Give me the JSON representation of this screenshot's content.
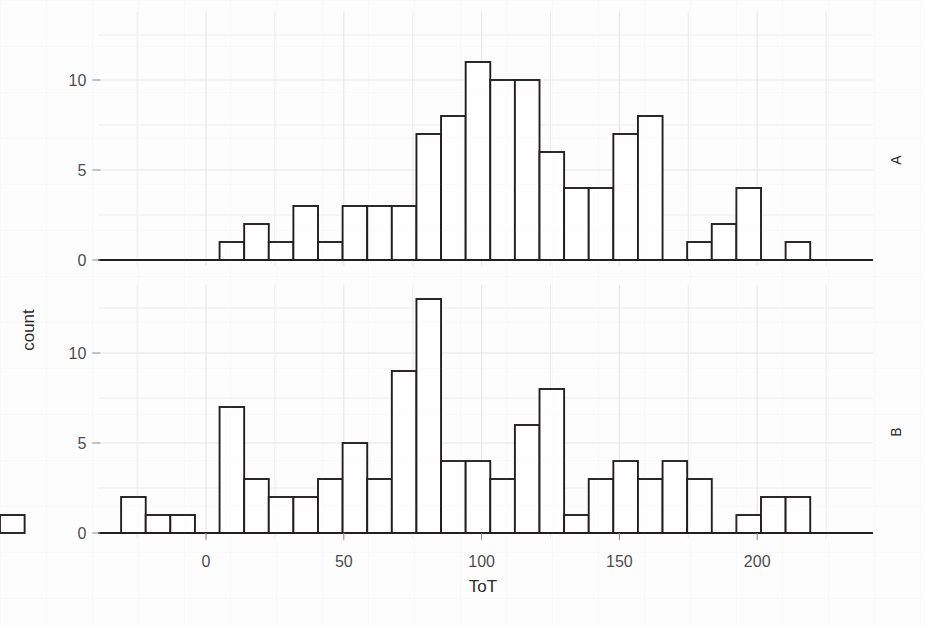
{
  "chart_data": {
    "type": "bar",
    "chart_kind": "histogram",
    "title": "",
    "xlabel": "ToT",
    "ylabel": "count",
    "facet_labels": [
      "A",
      "B"
    ],
    "facet_label_position": "right",
    "grid": true,
    "legend": "none",
    "xlim": [
      -34,
      234
    ],
    "ylim": [
      0,
      13.8
    ],
    "xticks": [
      0,
      50,
      100,
      150,
      200
    ],
    "xtick_labels": [
      "0",
      "50",
      "100",
      "150",
      "200"
    ],
    "yticks": [
      0,
      5,
      10
    ],
    "ytick_labels": [
      "0",
      "5",
      "10"
    ],
    "bin_width": 8.93,
    "bin_start": -30.8,
    "panels": [
      {
        "name": "A",
        "bin_left_edges": [
          -30.8,
          -21.87,
          -12.94,
          -4.01,
          4.92,
          13.85,
          22.78,
          31.71,
          40.64,
          49.57,
          58.5,
          67.43,
          76.36,
          85.29,
          94.22,
          103.15,
          112.08,
          121.01,
          129.94,
          138.87,
          147.8,
          156.73,
          165.66,
          174.59,
          183.52,
          192.45,
          201.38,
          210.31,
          219.24
        ],
        "values": [
          0,
          0,
          0,
          0,
          1,
          2,
          1,
          3,
          1,
          3,
          3,
          3,
          7,
          8,
          11,
          10,
          10,
          6,
          4,
          4,
          7,
          8,
          0,
          1,
          2,
          4,
          0,
          1,
          0
        ]
      },
      {
        "name": "B",
        "bin_left_edges": [
          -30.8,
          -21.87,
          -12.94,
          -4.01,
          4.92,
          13.85,
          22.78,
          31.71,
          40.64,
          49.57,
          58.5,
          67.43,
          76.36,
          85.29,
          94.22,
          103.15,
          112.08,
          121.01,
          129.94,
          138.87,
          147.8,
          156.73,
          165.66,
          174.59,
          183.52,
          192.45,
          201.38,
          210.31,
          219.24
        ],
        "values": [
          2,
          1,
          1,
          0,
          7,
          3,
          2,
          2,
          3,
          5,
          3,
          9,
          13,
          4,
          4,
          3,
          6,
          8,
          1,
          3,
          4,
          3,
          4,
          3,
          0,
          1,
          2,
          2,
          0,
          1
        ]
      }
    ]
  },
  "axes": {
    "y_title": "count",
    "x_title": "ToT"
  },
  "strips": {
    "top": "A",
    "bottom": "B"
  }
}
